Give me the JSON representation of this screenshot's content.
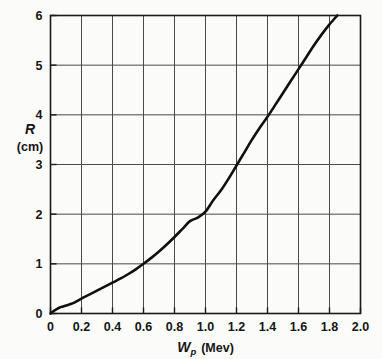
{
  "chart_data": {
    "type": "line",
    "title": "",
    "subtitle": "",
    "xlabel": "W_p (Mev)",
    "xlabel_symbol": "W",
    "xlabel_subscript": "p",
    "xlabel_units": "(Mev)",
    "ylabel": "R",
    "ylabel_units": "(cm)",
    "xlim": [
      0,
      2.0
    ],
    "ylim": [
      0,
      6
    ],
    "xticks": [
      0,
      0.2,
      0.4,
      0.6,
      0.8,
      1.0,
      1.2,
      1.4,
      1.6,
      1.8,
      2.0
    ],
    "xtick_labels": [
      "0",
      "0.2",
      "0.4",
      "0.6",
      "0.8",
      "1.0",
      "1.2",
      "1.4",
      "1.6",
      "1.8",
      "2.0"
    ],
    "yticks": [
      0,
      1,
      2,
      3,
      4,
      5,
      6
    ],
    "ytick_labels": [
      "0",
      "1",
      "2",
      "3",
      "4",
      "5",
      "6"
    ],
    "grid": true,
    "grid_x_spacing": 0.2,
    "grid_y_spacing": 1,
    "legend": null,
    "legend_position": "none",
    "series": [
      {
        "name": "range-energy curve",
        "color": "#101010",
        "line_width": 2.6,
        "x": [
          0.0,
          0.02,
          0.04,
          0.06,
          0.08,
          0.1,
          0.13,
          0.16,
          0.2,
          0.25,
          0.3,
          0.35,
          0.4,
          0.45,
          0.5,
          0.55,
          0.6,
          0.65,
          0.7,
          0.75,
          0.8,
          0.85,
          0.9,
          0.95,
          1.0,
          1.05,
          1.1,
          1.15,
          1.2,
          1.25,
          1.3,
          1.35,
          1.4,
          1.45,
          1.5,
          1.55,
          1.6,
          1.65,
          1.7,
          1.75,
          1.8,
          1.85
        ],
        "y": [
          0.0,
          0.05,
          0.09,
          0.12,
          0.14,
          0.16,
          0.19,
          0.23,
          0.3,
          0.38,
          0.46,
          0.54,
          0.62,
          0.7,
          0.79,
          0.89,
          1.0,
          1.12,
          1.25,
          1.39,
          1.54,
          1.7,
          1.86,
          1.93,
          2.05,
          2.28,
          2.48,
          2.72,
          2.98,
          3.24,
          3.5,
          3.74,
          3.96,
          4.2,
          4.44,
          4.68,
          4.92,
          5.16,
          5.4,
          5.62,
          5.82,
          6.0
        ]
      }
    ],
    "annotations": []
  },
  "figure": {
    "background_color": "#fbfbfa",
    "axis_color": "#1a1a1a",
    "grid_color": "#4a4a4a",
    "curve_color": "#101010"
  }
}
